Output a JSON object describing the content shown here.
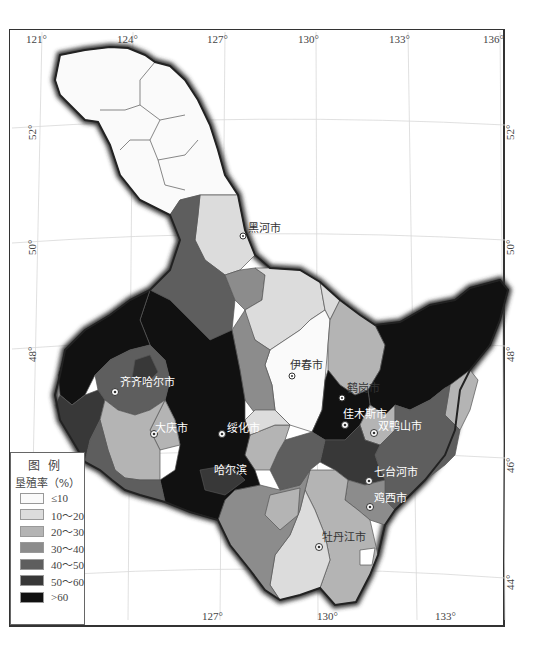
{
  "map": {
    "title": "黑龙江省垦殖率分布",
    "longitude_ticks_top": [
      "121°",
      "124°",
      "127°",
      "130°",
      "133°",
      "136°"
    ],
    "longitude_ticks_bottom": [
      "127°",
      "130°",
      "133°"
    ],
    "latitude_ticks_left": [
      "52°",
      "50°",
      "48°",
      "46°"
    ],
    "latitude_ticks_right": [
      "52°",
      "50°",
      "48°",
      "46°",
      "44°"
    ]
  },
  "legend": {
    "title": "图例",
    "subtitle": "垦殖率（%）",
    "classes": [
      {
        "label": "≤10",
        "color": "#fafafa"
      },
      {
        "label": "10～20",
        "color": "#dcdcdc"
      },
      {
        "label": "20～30",
        "color": "#b4b4b4"
      },
      {
        "label": "30～40",
        "color": "#8c8c8c"
      },
      {
        "label": "40～50",
        "color": "#5e5e5e"
      },
      {
        "label": "50～60",
        "color": "#383838"
      },
      {
        "label": ">60",
        "color": "#111111"
      }
    ]
  },
  "cities": [
    {
      "name": "黑河市"
    },
    {
      "name": "伊春市"
    },
    {
      "name": "齐齐哈尔市"
    },
    {
      "name": "鹤岗市"
    },
    {
      "name": "佳木斯市"
    },
    {
      "name": "双鸭山市"
    },
    {
      "name": "大庆市"
    },
    {
      "name": "绥化市"
    },
    {
      "name": "哈尔滨"
    },
    {
      "name": "七台河市"
    },
    {
      "name": "鸡西市"
    },
    {
      "name": "牡丹江市"
    }
  ]
}
